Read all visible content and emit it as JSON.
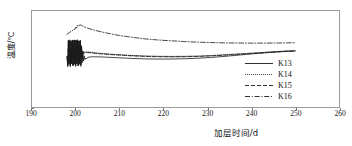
{
  "chart_data": {
    "type": "line",
    "title": "",
    "xlabel": "加层时间/d",
    "ylabel": "温度/℃",
    "xlim": [
      190,
      260
    ],
    "ylim": [
      0,
      18
    ],
    "xticks": [
      190,
      200,
      210,
      220,
      230,
      240,
      250,
      260
    ],
    "yticks": [
      0,
      2,
      4,
      6,
      8,
      10,
      12,
      14,
      16,
      18
    ],
    "grid": false,
    "legend_position": "lower-right-inside",
    "line_color": "#1a1a1a",
    "frame_color": "#9a9a9a",
    "series": [
      {
        "name": "K13",
        "style": "solid",
        "x": [
          198.0,
          198.15,
          198.3,
          198.45,
          198.6,
          198.75,
          198.9,
          199.05,
          199.2,
          199.35,
          199.5,
          199.65,
          199.8,
          199.95,
          200.1,
          200.25,
          200.4,
          200.55,
          200.7,
          200.85,
          201.0,
          201.15,
          201.3,
          201.45,
          201.6,
          201.75,
          201.9,
          202.05,
          202.2,
          202.4,
          202.7,
          203.0,
          203.5,
          204.0,
          205.0,
          206.0,
          208.0,
          210.0,
          213.0,
          216.0,
          219.0,
          222.0,
          225.0,
          228.0,
          231.0,
          234.0,
          237.0,
          240.0,
          243.0,
          246.0,
          248.0,
          250.0
        ],
        "y": [
          9.4,
          7.6,
          12.4,
          8.0,
          12.5,
          7.6,
          12.3,
          8.1,
          12.5,
          7.7,
          12.4,
          8.0,
          12.5,
          7.6,
          12.4,
          8.1,
          12.5,
          7.7,
          12.3,
          8.0,
          12.4,
          7.6,
          11.5,
          8.3,
          10.5,
          8.6,
          9.6,
          8.9,
          9.2,
          9.0,
          9.3,
          9.35,
          9.4,
          9.42,
          9.4,
          9.38,
          9.3,
          9.22,
          9.1,
          9.02,
          8.98,
          9.0,
          9.05,
          9.15,
          9.3,
          9.5,
          9.72,
          9.95,
          10.15,
          10.35,
          10.45,
          10.5
        ]
      },
      {
        "name": "K14",
        "style": "dotted",
        "x": [
          198.0,
          198.15,
          198.3,
          198.45,
          198.6,
          198.75,
          198.9,
          199.05,
          199.2,
          199.35,
          199.5,
          199.65,
          199.8,
          199.95,
          200.1,
          200.25,
          200.4,
          200.55,
          200.7,
          200.85,
          201.0,
          201.15,
          201.3,
          201.45,
          201.6,
          201.8,
          202.0,
          202.3,
          202.6,
          203.0,
          203.5,
          204.0,
          205.0,
          206.0,
          208.0,
          210.0,
          213.0,
          216.0,
          219.0,
          222.0,
          225.0,
          228.0,
          231.0,
          234.0,
          237.0,
          240.0,
          243.0,
          246.0,
          248.0,
          250.0
        ],
        "y": [
          9.5,
          7.7,
          12.5,
          8.1,
          12.6,
          7.7,
          12.4,
          8.2,
          12.6,
          7.8,
          12.5,
          8.1,
          12.6,
          7.7,
          12.5,
          8.2,
          12.6,
          7.8,
          12.4,
          8.1,
          12.5,
          8.0,
          11.2,
          9.2,
          10.4,
          10.2,
          10.25,
          10.3,
          10.3,
          10.28,
          10.25,
          10.2,
          10.1,
          10.02,
          9.9,
          9.8,
          9.65,
          9.55,
          9.5,
          9.48,
          9.5,
          9.55,
          9.65,
          9.8,
          9.95,
          10.1,
          10.25,
          10.4,
          10.5,
          10.55
        ]
      },
      {
        "name": "K15",
        "style": "dashed",
        "x": [
          198.0,
          198.15,
          198.3,
          198.45,
          198.6,
          198.75,
          198.9,
          199.05,
          199.2,
          199.35,
          199.5,
          199.65,
          199.8,
          199.95,
          200.1,
          200.25,
          200.4,
          200.55,
          200.7,
          200.85,
          201.0,
          201.15,
          201.3,
          201.45,
          201.6,
          201.8,
          202.0,
          202.3,
          202.6,
          203.0,
          203.5,
          204.0,
          205.0,
          206.0,
          208.0,
          210.0,
          213.0,
          216.0,
          219.0,
          222.0,
          225.0,
          228.0,
          231.0,
          234.0,
          237.0,
          240.0,
          243.0,
          246.0,
          248.0,
          250.0
        ],
        "y": [
          9.45,
          7.65,
          12.45,
          8.05,
          12.55,
          7.65,
          12.35,
          8.15,
          12.55,
          7.75,
          12.45,
          8.05,
          12.55,
          7.65,
          12.45,
          8.15,
          12.55,
          7.75,
          12.35,
          8.05,
          12.45,
          7.9,
          11.0,
          9.0,
          10.2,
          10.1,
          10.15,
          10.2,
          10.2,
          10.18,
          10.15,
          10.1,
          10.0,
          9.95,
          9.82,
          9.72,
          9.58,
          9.48,
          9.42,
          9.4,
          9.42,
          9.48,
          9.58,
          9.72,
          9.88,
          10.02,
          10.18,
          10.32,
          10.42,
          10.48
        ]
      },
      {
        "name": "K16",
        "style": "dashdot",
        "x": [
          198.0,
          198.3,
          198.6,
          198.9,
          199.2,
          199.5,
          199.8,
          200.0,
          200.2,
          200.4,
          200.6,
          200.8,
          201.0,
          201.2,
          201.5,
          202.0,
          203.0,
          204.0,
          206.0,
          208.0,
          210.0,
          213.0,
          216.0,
          219.0,
          222.0,
          225.0,
          228.0,
          231.0,
          234.0,
          237.0,
          240.0,
          243.0,
          246.0,
          248.0,
          250.0
        ],
        "y": [
          13.6,
          13.9,
          14.0,
          14.2,
          14.3,
          14.6,
          14.55,
          15.0,
          14.8,
          15.3,
          15.1,
          15.35,
          15.4,
          15.35,
          15.2,
          15.0,
          14.7,
          14.45,
          14.05,
          13.7,
          13.4,
          13.05,
          12.75,
          12.55,
          12.4,
          12.25,
          12.15,
          12.08,
          12.02,
          12.0,
          11.98,
          11.98,
          12.0,
          12.02,
          12.05
        ]
      }
    ],
    "legend": [
      {
        "label": "K13",
        "style": "solid"
      },
      {
        "label": "K14",
        "style": "dotted"
      },
      {
        "label": "K15",
        "style": "dashed"
      },
      {
        "label": "K16",
        "style": "dashdot"
      }
    ]
  }
}
